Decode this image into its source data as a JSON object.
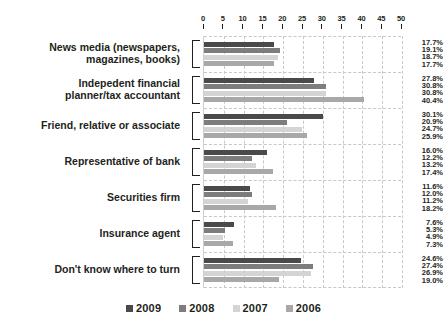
{
  "chart_data": {
    "type": "bar",
    "orientation": "horizontal",
    "title": "",
    "xlabel": "",
    "ylabel": "",
    "xlim": [
      0,
      50
    ],
    "xticks": [
      0,
      5,
      10,
      15,
      20,
      25,
      30,
      35,
      40,
      45,
      50
    ],
    "xtick_labels": [
      "0",
      "5",
      "10",
      "15",
      "20",
      "25",
      "30",
      "35",
      "40",
      "45",
      "50"
    ],
    "grid": true,
    "grid_axis": "x",
    "legend_position": "bottom",
    "value_label_suffix": "%",
    "categories": [
      "News media (newspapers, magazines, books)",
      "Indepedent financial planner/tax accountant",
      "Friend, relative or associate",
      "Representative of bank",
      "Securities firm",
      "Insurance agent",
      "Don't know where to turn"
    ],
    "category_lines": [
      [
        "News media (newspapers,",
        "magazines, books)"
      ],
      [
        "Indepedent financial",
        "planner/tax accountant"
      ],
      [
        "Friend, relative or associate"
      ],
      [
        "Representative of bank"
      ],
      [
        "Securities firm"
      ],
      [
        "Insurance agent"
      ],
      [
        "Don't know where to turn"
      ]
    ],
    "series": [
      {
        "name": "2009",
        "color": "#4a4a4a",
        "values": [
          17.7,
          27.8,
          30.1,
          16.0,
          11.6,
          7.6,
          24.6
        ],
        "labels": [
          "17.7%",
          "27.8%",
          "30.1%",
          "16.0%",
          "11.6%",
          "7.6%",
          "24.6%"
        ]
      },
      {
        "name": "2008",
        "color": "#7d7d7d",
        "values": [
          19.1,
          30.8,
          20.9,
          12.2,
          12.0,
          5.3,
          27.4
        ],
        "labels": [
          "19.1%",
          "30.8%",
          "20.9%",
          "12.2%",
          "12.0%",
          "5.3%",
          "27.4%"
        ]
      },
      {
        "name": "2007",
        "color": "#d4d4d4",
        "values": [
          18.7,
          30.8,
          24.7,
          13.2,
          11.2,
          4.9,
          26.9
        ],
        "labels": [
          "18.7%",
          "30.8%",
          "24.7%",
          "13.2%",
          "11.2%",
          "4.9%",
          "26.9%"
        ]
      },
      {
        "name": "2006",
        "color": "#a8a8a8",
        "values": [
          17.7,
          40.4,
          25.9,
          17.4,
          18.2,
          7.3,
          19.0
        ],
        "labels": [
          "17.7%",
          "40.4%",
          "25.9%",
          "17.4%",
          "18.2%",
          "7.3%",
          "19.0%"
        ]
      }
    ]
  }
}
